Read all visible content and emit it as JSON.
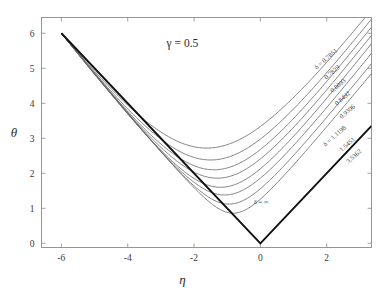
{
  "figure": {
    "background_color": "#ffffff",
    "frame_color": "#8a8a8a",
    "curve_color": "#6b6b6b",
    "bold_curve_color": "#111111"
  },
  "annotations": {
    "gamma": "γ = 0.5",
    "delta_infinity": "δ = ∞"
  },
  "chart_data": {
    "type": "line",
    "title": "",
    "subtitle": "",
    "xlabel": "η",
    "ylabel": "θ",
    "xlim": [
      -6.6,
      3.35
    ],
    "ylim": [
      -0.12,
      6.45
    ],
    "xticks": [
      -6,
      -4,
      -2,
      0,
      2
    ],
    "xtick_labels": [
      "-6",
      "-4",
      "-2",
      "0",
      "2"
    ],
    "yticks": [
      0,
      1,
      2,
      3,
      4,
      5,
      6
    ],
    "ytick_labels": [
      "0",
      "1",
      "2",
      "3",
      "4",
      "5",
      "6"
    ],
    "grid": false,
    "legend_position": "inline-curve-labels",
    "annotations": [
      {
        "text": "γ = 0.5",
        "x": -2.35,
        "y": 5.62
      },
      {
        "text": "δ = ∞",
        "x": 0.02,
        "y": 1.12
      }
    ],
    "common_origin": {
      "x": -6,
      "y": 6
    },
    "asymptote_vertex": {
      "x": 0,
      "y": 0
    },
    "series": [
      {
        "name": "δ = 0.7851",
        "label": "δ = 0.7851",
        "delta": 0.7851,
        "minimum": {
          "x": -1.62,
          "y": 2.72
        },
        "label_pos": {
          "x": 2.02,
          "y": 5.22
        },
        "label_angle": -41
      },
      {
        "name": "0.7829",
        "label": "0.7829",
        "delta": 0.7829,
        "minimum": {
          "x": -1.5,
          "y": 2.38
        },
        "label_pos": {
          "x": 2.2,
          "y": 4.84
        },
        "label_angle": -41
      },
      {
        "name": "0.8093",
        "label": "0.8093",
        "delta": 0.8093,
        "minimum": {
          "x": -1.4,
          "y": 2.1
        },
        "label_pos": {
          "x": 2.38,
          "y": 4.46
        },
        "label_angle": -41
      },
      {
        "name": "0.8492",
        "label": "0.8492",
        "delta": 0.8492,
        "minimum": {
          "x": -1.3,
          "y": 1.86
        },
        "label_pos": {
          "x": 2.52,
          "y": 4.1
        },
        "label_angle": -41
      },
      {
        "name": "0.9396",
        "label": "0.9396",
        "delta": 0.9396,
        "minimum": {
          "x": -1.2,
          "y": 1.6
        },
        "label_pos": {
          "x": 2.66,
          "y": 3.72
        },
        "label_angle": -41
      },
      {
        "name": "δ = 1.1198",
        "label": "δ = 1.1198",
        "delta": 1.1198,
        "minimum": {
          "x": -1.08,
          "y": 1.38
        },
        "label_pos": {
          "x": 2.28,
          "y": 3.02
        },
        "label_angle": -41
      },
      {
        "name": "1.5451",
        "label": "1.5451",
        "delta": 1.5451,
        "minimum": {
          "x": -0.95,
          "y": 1.12
        },
        "label_pos": {
          "x": 2.66,
          "y": 2.78
        },
        "label_angle": -41
      },
      {
        "name": "3.5362",
        "label": "3.5362",
        "delta": 3.5362,
        "minimum": {
          "x": -0.82,
          "y": 0.86
        },
        "label_pos": {
          "x": 2.86,
          "y": 2.44
        },
        "label_angle": -41
      },
      {
        "name": "δ = ∞",
        "label": "δ = ∞",
        "delta": null,
        "minimum": {
          "x": 0,
          "y": 0
        },
        "label_pos": {
          "x": 0.02,
          "y": 1.12
        },
        "label_angle": 0,
        "bold": true
      }
    ]
  }
}
